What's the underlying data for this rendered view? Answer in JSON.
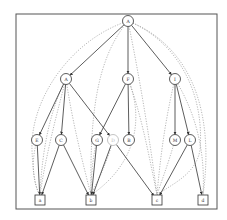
{
  "diagram": {
    "type": "hierarchical-graph",
    "frame": {
      "x": 16,
      "y": 14,
      "w": 201,
      "h": 195,
      "stroke": "#555555"
    },
    "colors": {
      "solid_edge": "#333333",
      "dotted_edge": "#9a9a9a",
      "node_stroke": "#333333",
      "faded_node_stroke": "#b5b5b5",
      "node_fill": "#ffffff"
    },
    "nodes": [
      {
        "id": "root",
        "label": "A",
        "shape": "circle",
        "x": 128,
        "y": 21,
        "r": 5.5
      },
      {
        "id": "A",
        "label": "A",
        "shape": "circle",
        "x": 66,
        "y": 79,
        "r": 5.5
      },
      {
        "id": "F",
        "label": "F",
        "shape": "circle",
        "x": 128,
        "y": 79,
        "r": 5.5
      },
      {
        "id": "I",
        "label": "I",
        "shape": "circle",
        "x": 175,
        "y": 79,
        "r": 5.5
      },
      {
        "id": "E",
        "label": "E",
        "shape": "circle",
        "x": 37,
        "y": 140,
        "r": 5.5
      },
      {
        "id": "C",
        "label": "C",
        "shape": "circle",
        "x": 61,
        "y": 140,
        "r": 5.5
      },
      {
        "id": "G",
        "label": "G",
        "shape": "circle",
        "x": 97,
        "y": 140,
        "r": 5.5
      },
      {
        "id": "D",
        "label": "D",
        "shape": "circle",
        "x": 113,
        "y": 140,
        "r": 5.5,
        "faded": true
      },
      {
        "id": "B",
        "label": "B",
        "shape": "circle",
        "x": 129,
        "y": 140,
        "r": 5.5
      },
      {
        "id": "M",
        "label": "M",
        "shape": "circle",
        "x": 175,
        "y": 140,
        "r": 5.5
      },
      {
        "id": "L",
        "label": "L",
        "shape": "circle",
        "x": 190,
        "y": 140,
        "r": 5.5
      },
      {
        "id": "a",
        "label": "a",
        "shape": "square",
        "x": 40,
        "y": 200,
        "s": 10
      },
      {
        "id": "b",
        "label": "b",
        "shape": "square",
        "x": 91,
        "y": 200,
        "s": 10
      },
      {
        "id": "c",
        "label": "c",
        "shape": "square",
        "x": 157,
        "y": 200,
        "s": 10
      },
      {
        "id": "d",
        "label": "d",
        "shape": "square",
        "x": 203,
        "y": 200,
        "s": 10
      }
    ],
    "solid_edges": [
      [
        "root",
        "A"
      ],
      [
        "root",
        "F"
      ],
      [
        "root",
        "I"
      ],
      [
        "A",
        "E"
      ],
      [
        "A",
        "C"
      ],
      [
        "A",
        "D"
      ],
      [
        "F",
        "G"
      ],
      [
        "F",
        "B"
      ],
      [
        "I",
        "M"
      ],
      [
        "I",
        "L"
      ],
      [
        "E",
        "a"
      ],
      [
        "C",
        "a"
      ],
      [
        "C",
        "b"
      ],
      [
        "G",
        "b"
      ],
      [
        "D",
        "b"
      ],
      [
        "D",
        "c"
      ],
      [
        "L",
        "c"
      ],
      [
        "L",
        "d"
      ]
    ],
    "dotted_edges": [
      {
        "d": "M128,21 C70,40 30,100 32,150 C33,175 36,190 40,195"
      },
      {
        "d": "M128,21 C95,60 90,120 91,195"
      },
      {
        "d": "M128,21 C140,80 150,140 157,195"
      },
      {
        "d": "M128,21 C190,45 215,110 203,195"
      },
      {
        "d": "M128,21 C175,40 205,90 200,150 C196,175 170,185 157,195"
      },
      {
        "d": "M66,79 C50,110 42,150 40,195"
      },
      {
        "d": "M66,79 C72,120 82,160 91,195"
      },
      {
        "d": "M66,79 C55,120 45,160 40,195"
      },
      {
        "d": "M128,79 C140,110 148,150 157,195"
      },
      {
        "d": "M128,79 C145,120 135,165 91,195"
      },
      {
        "d": "M175,79 C165,120 160,160 157,195"
      },
      {
        "d": "M175,79 C200,120 205,160 203,195"
      },
      {
        "d": "M37,140 C30,165 34,185 40,195"
      },
      {
        "d": "M97,140 C92,160 91,180 91,195"
      },
      {
        "d": "M113,140 C105,170 95,185 91,195"
      },
      {
        "d": "M175,140 C168,165 160,185 157,195"
      }
    ]
  }
}
